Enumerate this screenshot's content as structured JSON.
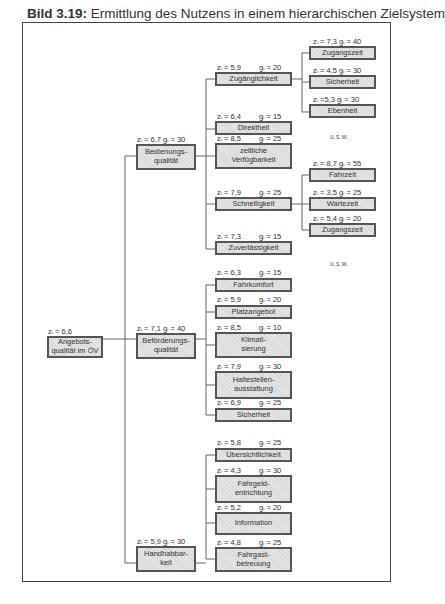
{
  "title": {
    "prefix": "Bild 3.19:",
    "text": " Ermittlung des Nutzens in einem hierarchischen Zielsystem"
  },
  "ellipsis": "u.s.w.",
  "root": {
    "label": "Angebots-\nqualität im ÖV",
    "z": "zᵢ = 6,6"
  },
  "level1": [
    {
      "label": "Bedienungs-\nqualität",
      "zg": "zᵢ = 6,7  gᵢ = 30"
    },
    {
      "label": "Beförderungs-\nqualität",
      "zg": "zᵢ = 7,1  gᵢ = 40"
    },
    {
      "label": "Handhabbar-\nkeit",
      "zg": "zᵢ = 5,9  gᵢ = 30"
    }
  ],
  "bedienung": [
    {
      "label": "Zugänglichkeit",
      "z": "zᵢ = 5,9",
      "g": "gᵢ = 20"
    },
    {
      "label": "Direktheit",
      "z": "zᵢ = 6,4",
      "g": "gᵢ = 15"
    },
    {
      "label": "zeitliche\nVerfügbarkeit",
      "z": "zᵢ = 8,5",
      "g": "gᵢ = 25"
    },
    {
      "label": "Schnelligkeit",
      "z": "zᵢ = 7,9",
      "g": "gᵢ = 25"
    },
    {
      "label": "Zuverlässigkeit",
      "z": "zᵢ = 7,3",
      "g": "gᵢ = 15"
    }
  ],
  "zugaenglichkeit": [
    {
      "label": "Zugangszeit",
      "zg": "zᵢ = 7,3    gᵢ = 40"
    },
    {
      "label": "Sicherheit",
      "zg": "zᵢ = 4,5  gᵢ = 30"
    },
    {
      "label": "Ebenheit",
      "zg": "zᵢ =5,3   gᵢ = 30"
    }
  ],
  "schnelligkeit": [
    {
      "label": "Fahrzeit",
      "zg": "zᵢ = 8,7  gᵢ = 55"
    },
    {
      "label": "Wartezeit",
      "zg": "zᵢ = 3,5  gᵢ = 25"
    },
    {
      "label": "Zugangszeit",
      "zg": "zᵢ = 5,4  gᵢ = 20"
    }
  ],
  "befoerderung": [
    {
      "label": "Fahrkomfort",
      "z": "zᵢ = 6,3",
      "g": "gᵢ = 15"
    },
    {
      "label": "Platzangebot",
      "z": "zᵢ = 5,9",
      "g": "gᵢ = 20"
    },
    {
      "label": "Klimati-\nsierung",
      "z": "zᵢ = 8,5",
      "g": "gᵢ = 10"
    },
    {
      "label": "Haltestellen-\nausstattung",
      "z": "zᵢ = 7,9",
      "g": "gᵢ = 30"
    },
    {
      "label": "Sicherheit",
      "z": "zᵢ = 6,9",
      "g": "gᵢ = 25"
    }
  ],
  "handhabbarkeit": [
    {
      "label": "Übersichtlichkeit",
      "z": "zᵢ = 5,8",
      "g": "gᵢ = 25"
    },
    {
      "label": "Fahrgeld-\nentrichtung",
      "z": "zᵢ = 4,3",
      "g": "gᵢ = 30"
    },
    {
      "label": "Information",
      "z": "zᵢ = 5,2",
      "g": "gᵢ = 20"
    },
    {
      "label": "Fahrgast-\nbetreuung",
      "z": "zᵢ = 4,8",
      "g": "gᵢ = 25"
    }
  ]
}
